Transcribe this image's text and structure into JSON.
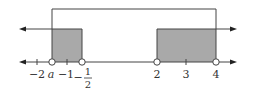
{
  "figure": {
    "type": "number-line-set-diagram",
    "colors": {
      "line": "#444444",
      "shade": "#a9a9a9",
      "circle_fill": "#ffffff"
    },
    "baseline": {
      "arrows": "both",
      "ticks": [
        {
          "value": -2,
          "label": "−2"
        },
        {
          "value": "a",
          "label": "a",
          "open_circle": true
        },
        {
          "value": -1,
          "label": "−1"
        },
        {
          "value": -0.5,
          "label_sign": "−",
          "label_num": "1",
          "label_den": "2",
          "open_circle": true
        },
        {
          "value": 2,
          "label": "2",
          "open_circle": true
        },
        {
          "value": 3,
          "label": "3"
        },
        {
          "value": 4,
          "label": "4",
          "open_circle": true
        }
      ]
    },
    "sets": [
      {
        "name": "set-A-left-ray",
        "description": "x < -1/2 (ray to the left)",
        "end": "-1/2",
        "open": true
      },
      {
        "name": "set-A-right-ray",
        "description": "x > 2 (ray to the right)",
        "start": "2",
        "open": true
      },
      {
        "name": "set-B-bracket",
        "description": "a < x < 4",
        "start": "a",
        "end": "4"
      }
    ],
    "shaded_regions": [
      {
        "from": "a",
        "to": "-1/2"
      },
      {
        "from": "2",
        "to": "4"
      }
    ]
  }
}
